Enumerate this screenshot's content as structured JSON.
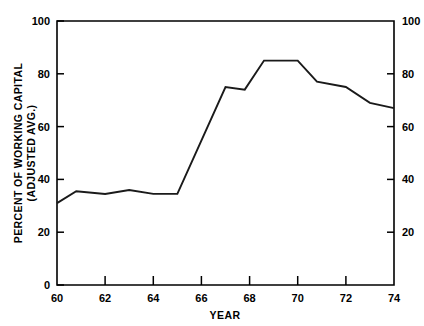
{
  "chart_data": {
    "type": "line",
    "title": "",
    "xlabel": "YEAR",
    "ylabel": "PERCENT OF WORKING CAPITAL (ADJUSTED AVG.)",
    "ylabel_line1": "PERCENT OF WORKING CAPITAL",
    "ylabel_line2": "(ADJUSTED AVG.)",
    "xlim": [
      60,
      74
    ],
    "ylim": [
      0,
      100
    ],
    "grid": false,
    "legend": "none",
    "right_axis": true,
    "x": [
      60,
      60.8,
      62,
      63,
      64,
      65,
      65.2,
      67,
      67.8,
      68.6,
      70,
      70.8,
      72,
      73,
      74
    ],
    "values": [
      31,
      35.5,
      34.5,
      36,
      34.5,
      34.5,
      34.5,
      75,
      74,
      85,
      85,
      77,
      75,
      69,
      67
    ],
    "series": [
      {
        "name": "Percent of working capital",
        "points": [
          {
            "x": 60,
            "y": 31
          },
          {
            "x": 60.8,
            "y": 35.5
          },
          {
            "x": 62,
            "y": 34.5
          },
          {
            "x": 63,
            "y": 36
          },
          {
            "x": 64,
            "y": 34.5
          },
          {
            "x": 65,
            "y": 34.5
          },
          {
            "x": 67,
            "y": 75
          },
          {
            "x": 67.8,
            "y": 74
          },
          {
            "x": 68.6,
            "y": 85
          },
          {
            "x": 70,
            "y": 85
          },
          {
            "x": 70.8,
            "y": 77
          },
          {
            "x": 72,
            "y": 75
          },
          {
            "x": 73,
            "y": 69
          },
          {
            "x": 74,
            "y": 67
          }
        ]
      }
    ],
    "x_ticks": [
      60,
      62,
      64,
      66,
      68,
      70,
      72,
      74
    ],
    "x_tick_labels": [
      "60",
      "62",
      "64",
      "66",
      "68",
      "70",
      "72",
      "74"
    ],
    "y_ticks": [
      0,
      20,
      40,
      60,
      80,
      100
    ],
    "y_tick_labels": [
      "0",
      "20",
      "40",
      "60",
      "80",
      "100"
    ],
    "y_ticks_right": [
      20,
      40,
      60,
      80,
      100
    ],
    "y_tick_labels_right": [
      "20",
      "40",
      "60",
      "80",
      "100"
    ],
    "line_color": "#1a1a1a",
    "axis_color": "#000000",
    "background_color": "#ffffff"
  }
}
